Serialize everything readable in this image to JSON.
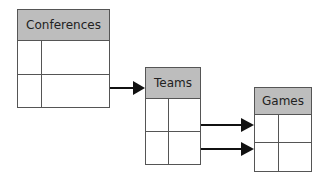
{
  "diagram": {
    "type": "entity-relationship",
    "entities": [
      {
        "name": "Conferences",
        "rows": 2,
        "columns": 2
      },
      {
        "name": "Teams",
        "rows": 2,
        "columns": 2
      },
      {
        "name": "Games",
        "rows": 2,
        "columns": 2
      }
    ],
    "relationships": [
      {
        "from": "Conferences",
        "to": "Teams"
      },
      {
        "from": "Teams",
        "to": "Games",
        "count": 2
      }
    ],
    "colors": {
      "header": "#bdbdbd",
      "border": "#555555",
      "arrow": "#111111"
    }
  }
}
